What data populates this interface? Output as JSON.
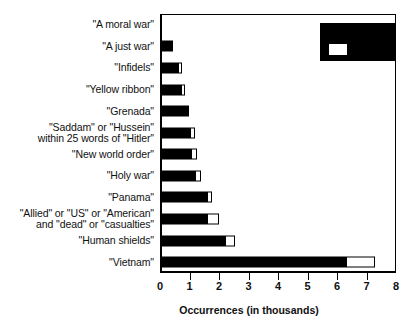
{
  "chart_data": {
    "type": "bar",
    "orientation": "horizontal",
    "stacked": true,
    "title": "",
    "xlabel": "Occurrences (in thousands)",
    "ylabel": "",
    "xlim": [
      0,
      8
    ],
    "xticks": [
      0,
      1,
      2,
      3,
      4,
      5,
      6,
      7,
      8
    ],
    "xtick_labels": [
      "0",
      "1",
      "2",
      "3",
      "4",
      "5",
      "6",
      "7",
      "8"
    ],
    "grid": false,
    "legend_position": "upper right",
    "categories": [
      "\"A moral war\"",
      "\"A just war\"",
      "\"Infidels\"",
      "\"Yellow ribbon\"",
      "\"Grenada\"",
      "\"Saddam\" or \"Hussein\"\nwithin 25 words of \"Hitler\"",
      "\"New world order\"",
      "\"Holy war\"",
      "\"Panama\"",
      "\"Allied\" or \"US\" or \"American\"\nand \"dead\" or \"casualties\"",
      "\"Human shields\"",
      "\"Vietnam\""
    ],
    "series": [
      {
        "name": "dark-segment",
        "color": "#000000",
        "values": [
          0.05,
          0.45,
          0.62,
          0.72,
          0.9,
          1.0,
          1.05,
          1.2,
          1.6,
          1.6,
          2.2,
          6.3
        ]
      },
      {
        "name": "light-segment",
        "color": "#ffffff",
        "values": [
          0.0,
          0.0,
          0.12,
          0.12,
          0.1,
          0.2,
          0.22,
          0.2,
          0.15,
          0.4,
          0.35,
          1.0
        ]
      }
    ],
    "totals": [
      0.05,
      0.45,
      0.74,
      0.84,
      1.0,
      1.2,
      1.27,
      1.4,
      1.75,
      2.0,
      2.55,
      7.3
    ]
  },
  "legend": {
    "swatch_color": "#ffffff",
    "box_color": "#000000"
  }
}
